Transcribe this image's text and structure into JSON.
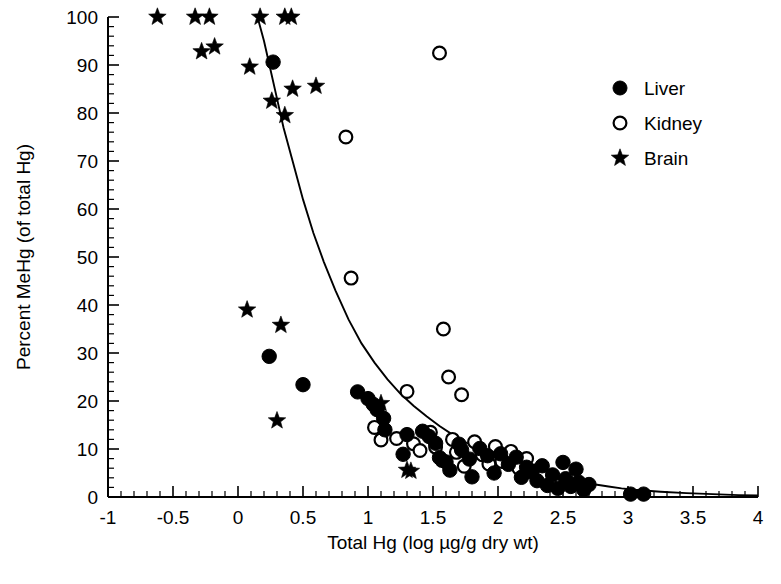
{
  "chart_data": {
    "type": "scatter",
    "title": "",
    "xlabel": "Total Hg (log µg/g dry wt)",
    "ylabel": "Percent MeHg (of total Hg)",
    "xlim": [
      -1,
      4
    ],
    "ylim": [
      0,
      100
    ],
    "xticks": [
      "-1",
      "-0.5",
      "0",
      "0.5",
      "1",
      "1.5",
      "2",
      "2.5",
      "3",
      "3.5",
      "4"
    ],
    "xtick_values": [
      -1,
      -0.5,
      0,
      0.5,
      1,
      1.5,
      2,
      2.5,
      3,
      3.5,
      4
    ],
    "yticks": [
      "0",
      "10",
      "20",
      "30",
      "40",
      "50",
      "60",
      "70",
      "80",
      "90",
      "100"
    ],
    "ytick_values": [
      0,
      10,
      20,
      30,
      40,
      50,
      60,
      70,
      80,
      90,
      100
    ],
    "x_minor_step": 0.1,
    "y_minor_step": 2,
    "grid": false,
    "legend_position": "top-right",
    "marker_color": "#000000",
    "curve_color": "#000000",
    "series": [
      {
        "name": "Liver",
        "marker": "filled-circle",
        "points": [
          [
            0.27,
            90.6
          ],
          [
            0.24,
            29.3
          ],
          [
            0.5,
            23.4
          ],
          [
            0.92,
            21.9
          ],
          [
            1.0,
            20.5
          ],
          [
            1.04,
            19.3
          ],
          [
            1.07,
            18.2
          ],
          [
            1.12,
            16.4
          ],
          [
            1.13,
            14.0
          ],
          [
            1.3,
            13.0
          ],
          [
            1.27,
            8.9
          ],
          [
            1.42,
            13.7
          ],
          [
            1.47,
            12.6
          ],
          [
            1.52,
            11.2
          ],
          [
            1.55,
            8.2
          ],
          [
            1.6,
            7.3
          ],
          [
            1.63,
            5.6
          ],
          [
            1.7,
            11.0
          ],
          [
            1.72,
            9.8
          ],
          [
            1.78,
            7.9
          ],
          [
            1.8,
            4.2
          ],
          [
            1.86,
            10.1
          ],
          [
            1.92,
            8.6
          ],
          [
            1.97,
            5.0
          ],
          [
            2.02,
            9.0
          ],
          [
            2.08,
            6.8
          ],
          [
            2.14,
            8.3
          ],
          [
            2.18,
            4.1
          ],
          [
            2.22,
            6.2
          ],
          [
            2.26,
            5.2
          ],
          [
            2.3,
            3.4
          ],
          [
            2.34,
            6.5
          ],
          [
            2.38,
            2.4
          ],
          [
            2.42,
            4.6
          ],
          [
            2.46,
            1.8
          ],
          [
            2.5,
            7.2
          ],
          [
            2.52,
            3.8
          ],
          [
            2.56,
            2.2
          ],
          [
            2.6,
            5.8
          ],
          [
            2.62,
            3.1
          ],
          [
            2.66,
            1.5
          ],
          [
            2.7,
            2.6
          ],
          [
            3.02,
            0.6
          ],
          [
            3.12,
            0.6
          ]
        ]
      },
      {
        "name": "Kidney",
        "marker": "open-circle",
        "points": [
          [
            1.55,
            92.5
          ],
          [
            0.83,
            75.0
          ],
          [
            0.87,
            45.6
          ],
          [
            1.58,
            35.0
          ],
          [
            1.62,
            25.0
          ],
          [
            1.72,
            21.3
          ],
          [
            1.3,
            22.0
          ],
          [
            1.05,
            14.5
          ],
          [
            1.1,
            11.9
          ],
          [
            1.22,
            12.2
          ],
          [
            1.35,
            11.1
          ],
          [
            1.4,
            9.7
          ],
          [
            1.48,
            13.5
          ],
          [
            1.52,
            10.4
          ],
          [
            1.57,
            7.6
          ],
          [
            1.65,
            12.0
          ],
          [
            1.68,
            9.3
          ],
          [
            1.74,
            6.4
          ],
          [
            1.82,
            11.5
          ],
          [
            1.88,
            8.8
          ],
          [
            1.93,
            6.9
          ],
          [
            1.98,
            10.5
          ],
          [
            2.03,
            7.4
          ],
          [
            2.1,
            9.5
          ],
          [
            2.16,
            6.0
          ],
          [
            2.22,
            8.0
          ],
          [
            2.28,
            5.4
          ],
          [
            2.34,
            4.4
          ]
        ]
      },
      {
        "name": "Brain",
        "marker": "star",
        "points": [
          [
            -0.62,
            100
          ],
          [
            -0.33,
            100
          ],
          [
            -0.22,
            100
          ],
          [
            0.17,
            100
          ],
          [
            0.36,
            100
          ],
          [
            0.41,
            100
          ],
          [
            -0.28,
            92.8
          ],
          [
            -0.18,
            93.8
          ],
          [
            0.09,
            89.6
          ],
          [
            0.42,
            85.0
          ],
          [
            0.6,
            85.6
          ],
          [
            0.26,
            82.5
          ],
          [
            0.36,
            79.5
          ],
          [
            0.07,
            39.0
          ],
          [
            0.33,
            35.8
          ],
          [
            0.3,
            15.9
          ],
          [
            1.1,
            19.5
          ],
          [
            1.3,
            5.6
          ],
          [
            1.33,
            5.4
          ]
        ]
      }
    ],
    "fit_curve": {
      "description": "decaying fitted regression curve",
      "points": [
        [
          0.15,
          100
        ],
        [
          0.2,
          95
        ],
        [
          0.25,
          89
        ],
        [
          0.3,
          83
        ],
        [
          0.35,
          77
        ],
        [
          0.42,
          70
        ],
        [
          0.5,
          62
        ],
        [
          0.58,
          55
        ],
        [
          0.66,
          49
        ],
        [
          0.75,
          43
        ],
        [
          0.85,
          37
        ],
        [
          0.95,
          32
        ],
        [
          1.05,
          28
        ],
        [
          1.15,
          24.5
        ],
        [
          1.25,
          21.5
        ],
        [
          1.35,
          19
        ],
        [
          1.45,
          16.8
        ],
        [
          1.55,
          14.8
        ],
        [
          1.65,
          13.0
        ],
        [
          1.75,
          11.4
        ],
        [
          1.85,
          10.0
        ],
        [
          1.95,
          8.8
        ],
        [
          2.05,
          7.7
        ],
        [
          2.15,
          6.7
        ],
        [
          2.25,
          5.8
        ],
        [
          2.35,
          5.0
        ],
        [
          2.45,
          4.3
        ],
        [
          2.55,
          3.7
        ],
        [
          2.65,
          3.1
        ],
        [
          2.75,
          2.6
        ],
        [
          2.85,
          2.2
        ],
        [
          2.95,
          1.8
        ],
        [
          3.05,
          1.5
        ],
        [
          3.25,
          1.1
        ],
        [
          3.45,
          0.8
        ],
        [
          3.65,
          0.6
        ],
        [
          3.85,
          0.4
        ],
        [
          4.0,
          0.3
        ]
      ]
    }
  },
  "legend": {
    "items": [
      {
        "label": "Liver",
        "marker": "filled-circle"
      },
      {
        "label": "Kidney",
        "marker": "open-circle"
      },
      {
        "label": "Brain",
        "marker": "star"
      }
    ]
  }
}
